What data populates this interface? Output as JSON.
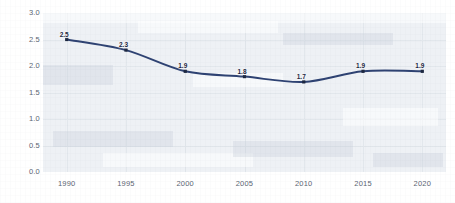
{
  "chart_data": {
    "type": "line",
    "title": "",
    "subtitle": "",
    "xlabel": "",
    "ylabel": "",
    "x": [
      1990,
      1995,
      2000,
      2005,
      2010,
      2015,
      2020
    ],
    "categories": [
      "1990",
      "1995",
      "2000",
      "2005",
      "2010",
      "2015",
      "2020"
    ],
    "values": [
      2.5,
      2.3,
      1.9,
      1.8,
      1.7,
      1.9,
      1.9
    ],
    "point_labels": [
      "2.5",
      "2.3",
      "1.9",
      "1.8",
      "1.7",
      "1.9",
      "1.9"
    ],
    "series": [
      {
        "name": "",
        "values": [
          2.5,
          2.3,
          1.9,
          1.8,
          1.7,
          1.9,
          1.9
        ],
        "color": "#2e4272",
        "marker": "square",
        "line_width": 2
      }
    ],
    "ylim": [
      0.0,
      3.0
    ],
    "xlim": [
      1988,
      2022
    ],
    "ytick_labels": [
      "0.0",
      "0.5",
      "1.0",
      "1.5",
      "2.0",
      "2.5",
      "3.0"
    ],
    "ytick_values": [
      0.0,
      0.5,
      1.0,
      1.5,
      2.0,
      2.5,
      3.0
    ],
    "xtick_labels": [
      "1990",
      "1995",
      "2000",
      "2005",
      "2010",
      "2015",
      "2020"
    ],
    "grid": true,
    "legend": false,
    "legend_position": "none",
    "plot_background": "#eef1f5",
    "grid_color": "#e2e7ec",
    "axis_label_color": "#5a6472",
    "data_label_color": "#1c2740",
    "page_background": "#ffffff"
  }
}
